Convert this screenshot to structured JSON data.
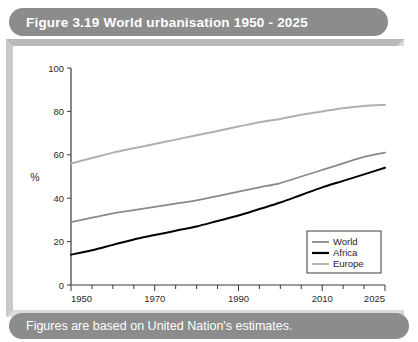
{
  "figure": {
    "title": "Figure 3.19 World urbanisation 1950 - 2025",
    "caption": "Figures are based on United Nation's estimates.",
    "title_bar_color": "#8c8c8c",
    "frame_color": "#c9c9c9",
    "title_text_color": "#ffffff"
  },
  "chart_data": {
    "type": "line",
    "title": "World urbanisation 1950 - 2025",
    "xlabel": "",
    "ylabel": "%",
    "x": [
      1950,
      1955,
      1960,
      1965,
      1970,
      1975,
      1980,
      1985,
      1990,
      1995,
      2000,
      2005,
      2010,
      2015,
      2020,
      2025
    ],
    "xlim": [
      1950,
      2025
    ],
    "ylim": [
      0,
      100
    ],
    "xticks": [
      1950,
      1970,
      1990,
      2010,
      2025
    ],
    "xtick_labels": [
      "1950",
      "1970",
      "1990",
      "2010",
      "2025"
    ],
    "xminor_step": 5,
    "yticks": [
      0,
      20,
      40,
      60,
      80,
      100
    ],
    "ytick_labels": [
      "0",
      "20",
      "40",
      "60",
      "80",
      "100"
    ],
    "grid": false,
    "legend_position": "lower right",
    "series": [
      {
        "name": "World",
        "color": "#8a8a8a",
        "width": 1.8,
        "values": [
          29,
          31,
          33,
          34.5,
          36,
          37.5,
          39,
          41,
          43,
          45,
          47,
          50,
          53,
          56,
          59,
          61
        ]
      },
      {
        "name": "Africa",
        "color": "#000000",
        "width": 2.0,
        "values": [
          14,
          16,
          18.5,
          21,
          23,
          25,
          27,
          29.5,
          32,
          35,
          38,
          41.5,
          45,
          48,
          51,
          54
        ]
      },
      {
        "name": "Europe",
        "color": "#b0b0b0",
        "width": 2.0,
        "values": [
          56,
          58.5,
          61,
          63,
          65,
          67,
          69,
          71,
          73,
          75,
          76.5,
          78.5,
          80,
          81.5,
          82.5,
          83
        ]
      }
    ]
  },
  "legend": {
    "entries": [
      {
        "label": "World",
        "color": "#8a8a8a"
      },
      {
        "label": "Africa",
        "color": "#000000"
      },
      {
        "label": "Europe",
        "color": "#b0b0b0"
      }
    ]
  }
}
